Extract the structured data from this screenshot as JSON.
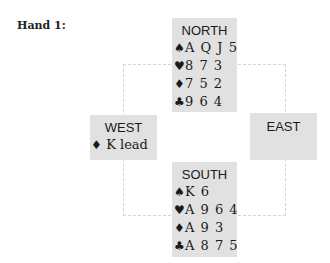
{
  "title": "Hand 1:",
  "colors": {
    "box_bg": "#e1e1e1",
    "dashed_border": "#d6d6d6",
    "text": "#1a1a1a"
  },
  "north": {
    "label": "NORTH",
    "suits": [
      {
        "icon": "spade-icon",
        "glyph": "♠",
        "cards": "A Q J 5"
      },
      {
        "icon": "heart-icon",
        "glyph": "♥",
        "cards": "8 7 3"
      },
      {
        "icon": "diamond-icon",
        "glyph": "♦",
        "cards": "7 5 2"
      },
      {
        "icon": "club-icon",
        "glyph": "♣",
        "cards": "9 6 4"
      }
    ]
  },
  "west": {
    "label": "WEST",
    "lead": {
      "icon": "diamond-icon",
      "glyph": "♦",
      "text": " K lead"
    }
  },
  "east": {
    "label": "EAST"
  },
  "south": {
    "label": "SOUTH",
    "suits": [
      {
        "icon": "spade-icon",
        "glyph": "♠",
        "cards": "K 6"
      },
      {
        "icon": "heart-icon",
        "glyph": "♥",
        "cards": "A 9 6 4"
      },
      {
        "icon": "diamond-icon",
        "glyph": "♦",
        "cards": "A 9 3"
      },
      {
        "icon": "club-icon",
        "glyph": "♣",
        "cards": "A 8 7 5"
      }
    ]
  }
}
